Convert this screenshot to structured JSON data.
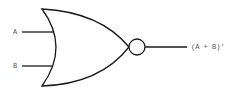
{
  "diagram": {
    "type": "logic-gate",
    "gate": "NOR",
    "inputs": [
      {
        "label": "A"
      },
      {
        "label": "B"
      }
    ],
    "output": {
      "label": "(A + B)'"
    },
    "colors": {
      "stroke": "#1a1a1a",
      "text": "#555555",
      "background": "#ffffff"
    }
  }
}
